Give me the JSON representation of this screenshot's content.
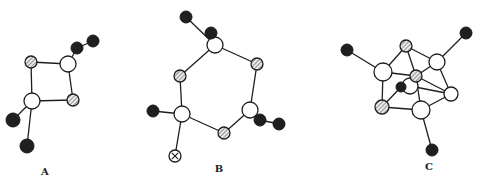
{
  "figure": {
    "structures": [
      {
        "id": "A",
        "label": "A",
        "atoms": [
          {
            "id": "a1",
            "type": "hatched"
          },
          {
            "id": "a2",
            "type": "white"
          },
          {
            "id": "a3",
            "type": "hatched"
          },
          {
            "id": "a4",
            "type": "white"
          },
          {
            "id": "a5",
            "type": "black"
          },
          {
            "id": "a6",
            "type": "black"
          },
          {
            "id": "a7",
            "type": "black"
          },
          {
            "id": "a8",
            "type": "black"
          }
        ],
        "bonds": [
          [
            "a1",
            "a2"
          ],
          [
            "a2",
            "a3"
          ],
          [
            "a3",
            "a4"
          ],
          [
            "a4",
            "a1"
          ],
          [
            "a2",
            "a5"
          ],
          [
            "a5",
            "a6"
          ],
          [
            "a4",
            "a7"
          ],
          [
            "a4",
            "a8"
          ]
        ]
      },
      {
        "id": "B",
        "label": "B",
        "atoms": [
          {
            "id": "b1",
            "type": "black"
          },
          {
            "id": "b2",
            "type": "black"
          },
          {
            "id": "b3",
            "type": "white"
          },
          {
            "id": "b4",
            "type": "hatched"
          },
          {
            "id": "b5",
            "type": "hatched"
          },
          {
            "id": "b6",
            "type": "white"
          },
          {
            "id": "b7",
            "type": "black"
          },
          {
            "id": "b8",
            "type": "crossed"
          },
          {
            "id": "b9",
            "type": "hatched"
          },
          {
            "id": "b10",
            "type": "white"
          },
          {
            "id": "b11",
            "type": "black"
          },
          {
            "id": "b12",
            "type": "black"
          }
        ],
        "bonds": [
          [
            "b1",
            "b3"
          ],
          [
            "b3",
            "b4"
          ],
          [
            "b3",
            "b5"
          ],
          [
            "b4",
            "b6"
          ],
          [
            "b6",
            "b7"
          ],
          [
            "b6",
            "b8"
          ],
          [
            "b6",
            "b9"
          ],
          [
            "b9",
            "b10"
          ],
          [
            "b10",
            "b5"
          ],
          [
            "b10",
            "b11"
          ],
          [
            "b11",
            "b12"
          ]
        ]
      },
      {
        "id": "C",
        "label": "C",
        "atoms": [
          {
            "id": "c1",
            "type": "black"
          },
          {
            "id": "c2",
            "type": "white"
          },
          {
            "id": "c3",
            "type": "hatched"
          },
          {
            "id": "c4",
            "type": "white"
          },
          {
            "id": "c5",
            "type": "black"
          },
          {
            "id": "c6",
            "type": "black"
          },
          {
            "id": "c7",
            "type": "white"
          },
          {
            "id": "c8",
            "type": "hatched"
          },
          {
            "id": "c9",
            "type": "white"
          },
          {
            "id": "c10",
            "type": "hatched"
          },
          {
            "id": "c11",
            "type": "white"
          },
          {
            "id": "c12",
            "type": "black"
          }
        ],
        "bonds": [
          [
            "c1",
            "c2"
          ],
          [
            "c2",
            "c3"
          ],
          [
            "c3",
            "c4"
          ],
          [
            "c4",
            "c5"
          ],
          [
            "c3",
            "c8"
          ],
          [
            "c2",
            "c8"
          ],
          [
            "c2",
            "c10"
          ],
          [
            "c10",
            "c6"
          ],
          [
            "c10",
            "c11"
          ],
          [
            "c8",
            "c4"
          ],
          [
            "c8",
            "c9"
          ],
          [
            "c8",
            "c11"
          ],
          [
            "c4",
            "c9"
          ],
          [
            "c9",
            "c11"
          ],
          [
            "c11",
            "c12"
          ],
          [
            "c7",
            "c9"
          ]
        ]
      }
    ]
  }
}
